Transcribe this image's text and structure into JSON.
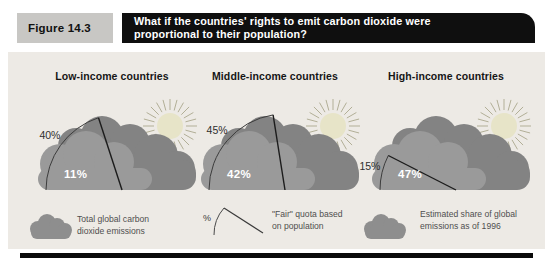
{
  "header": {
    "figure_label": "Figure 14.3",
    "title_line1": "What if the countries' rights to emit carbon dioxide were",
    "title_line2": "proportional to their population?"
  },
  "panels": [
    {
      "title": "Low-income countries",
      "quota_pct": 40,
      "share_pct": 11,
      "quota_label": "40%",
      "share_label": "11%"
    },
    {
      "title": "Middle-income countries",
      "quota_pct": 45,
      "share_pct": 42,
      "quota_label": "45%",
      "share_label": "42%"
    },
    {
      "title": "High-income countries",
      "quota_pct": 15,
      "share_pct": 47,
      "quota_label": "15%",
      "share_label": "47%"
    }
  ],
  "legend": [
    {
      "icon": "cloud-icon",
      "label_line1": "Total global carbon",
      "label_line2": "dioxide emissions"
    },
    {
      "icon": "wedge-icon",
      "symbol": "%",
      "label_line1": "\"Fair\" quota based",
      "label_line2": "on population"
    },
    {
      "icon": "cloud-icon",
      "label_line1": "Estimated share of global",
      "label_line2": "emissions as of 1996"
    }
  ],
  "colors": {
    "content_bg": "#edeae5",
    "figure_label_bg": "#c8c7c4",
    "title_bg": "#0f0f0f",
    "cloud_back": "#838383",
    "cloud_front": "#9a9a9a",
    "sun": "#e7e4c8",
    "sun_rays": "#b2af97"
  },
  "chart_data": {
    "type": "pie",
    "title": "What if the countries' rights to emit carbon dioxide were proportional to their population?",
    "subtitle": "Figure 14.3",
    "categories": [
      "Low-income countries",
      "Middle-income countries",
      "High-income countries"
    ],
    "series": [
      {
        "name": "\"Fair\" quota based on population",
        "values": [
          40,
          45,
          15
        ]
      },
      {
        "name": "Estimated share of global emissions as of 1996",
        "values": [
          11,
          42,
          47
        ]
      }
    ],
    "units": "%",
    "wedge_span_degrees": 180,
    "legend_position": "bottom"
  }
}
